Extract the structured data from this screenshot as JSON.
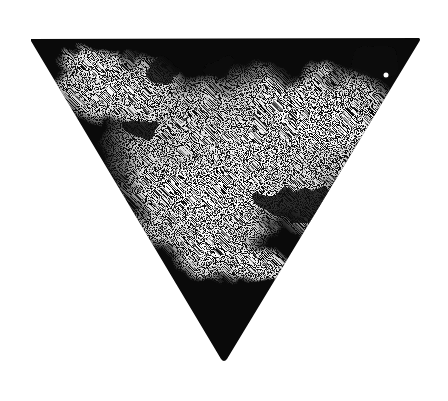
{
  "image": {
    "subject": "inverted-triangle",
    "style": "grunge ink stamp texture",
    "background": "#ffffff",
    "ink": "#0a0a0a",
    "paper": "#ffffff",
    "triangle": {
      "top_left": [
        31,
        39
      ],
      "top_right": [
        419,
        38
      ],
      "bottom": [
        224,
        361
      ]
    }
  }
}
